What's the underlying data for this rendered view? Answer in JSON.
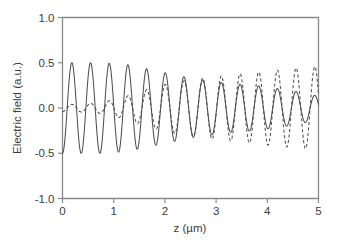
{
  "chart_data": {
    "type": "line",
    "title": "",
    "subtitle": "",
    "xlabel": "z (µm)",
    "ylabel": "Electric field (a.u.)",
    "xlim": [
      0,
      5
    ],
    "ylim": [
      -1.0,
      1.0
    ],
    "xticks": [
      0,
      1,
      2,
      3,
      4,
      5
    ],
    "xtick_labels": [
      "0",
      "1",
      "2",
      "3",
      "4",
      "5"
    ],
    "yticks": [
      -1.0,
      -0.5,
      0.0,
      0.5,
      1.0
    ],
    "ytick_labels": [
      "-1.0",
      "-0.5",
      "0.0",
      "0.5",
      "1.0"
    ],
    "grid": false,
    "legend": "none",
    "annotations": [],
    "oscillation_period_um": 0.365,
    "phase_offset_rad": 3.1416,
    "series": [
      {
        "name": "pump field",
        "style": "solid",
        "color": "#4f4f4f",
        "description": "Starts at large amplitude ~0.50 near z=0 and decays to ~0.13 at z=5",
        "envelope_x": [
          0.0,
          0.25,
          0.5,
          0.75,
          1.0,
          1.25,
          1.5,
          1.75,
          2.0,
          2.25,
          2.5,
          2.75,
          3.0,
          3.25,
          3.5,
          3.75,
          4.0,
          4.25,
          4.5,
          4.75,
          5.0
        ],
        "envelope_y": [
          0.5,
          0.5,
          0.5,
          0.5,
          0.49,
          0.48,
          0.45,
          0.42,
          0.39,
          0.36,
          0.33,
          0.31,
          0.29,
          0.27,
          0.26,
          0.25,
          0.23,
          0.21,
          0.19,
          0.16,
          0.13
        ]
      },
      {
        "name": "generated field",
        "style": "dashed",
        "color": "#4f4f4f",
        "description": "Starts near zero amplitude ~0.04 at z=0 and grows to ~0.46 at z=5",
        "envelope_x": [
          0.0,
          0.25,
          0.5,
          0.75,
          1.0,
          1.25,
          1.5,
          1.75,
          2.0,
          2.25,
          2.5,
          2.75,
          3.0,
          3.25,
          3.5,
          3.75,
          4.0,
          4.25,
          4.5,
          4.75,
          5.0
        ],
        "envelope_y": [
          0.04,
          0.04,
          0.05,
          0.06,
          0.09,
          0.13,
          0.18,
          0.22,
          0.26,
          0.29,
          0.31,
          0.33,
          0.35,
          0.36,
          0.38,
          0.39,
          0.41,
          0.42,
          0.44,
          0.45,
          0.46
        ]
      }
    ]
  },
  "axes": {
    "y_title": "Electric field (a.u.)",
    "x_title": "z (µm)"
  }
}
